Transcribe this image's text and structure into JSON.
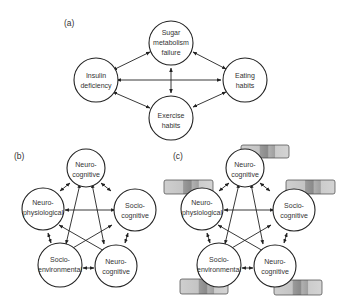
{
  "panels": {
    "a": {
      "label": "(a)",
      "nodes": [
        {
          "id": "sugar",
          "lines": [
            "Sugar",
            "metabolism",
            "failure"
          ]
        },
        {
          "id": "insulin",
          "lines": [
            "Insulin",
            "deficiency"
          ]
        },
        {
          "id": "eating",
          "lines": [
            "Eating",
            "habits"
          ]
        },
        {
          "id": "exercise",
          "lines": [
            "Exercise",
            "habits"
          ]
        }
      ]
    },
    "b": {
      "label": "(b)",
      "nodes": [
        {
          "id": "top",
          "lines": [
            "Neuro-",
            "cognitive"
          ]
        },
        {
          "id": "left",
          "lines": [
            "Neuro-",
            "physiological"
          ]
        },
        {
          "id": "right",
          "lines": [
            "Socio-",
            "cognitive"
          ]
        },
        {
          "id": "bl",
          "lines": [
            "Socio-",
            "environmental"
          ]
        },
        {
          "id": "br",
          "lines": [
            "Neuro-",
            "cognitive"
          ]
        }
      ]
    },
    "c": {
      "label": "(c)",
      "nodes": [
        {
          "id": "top",
          "lines": [
            "Neuro-",
            "cognitive"
          ]
        },
        {
          "id": "left",
          "lines": [
            "Neuro-",
            "physiological"
          ]
        },
        {
          "id": "right",
          "lines": [
            "Socio-",
            "cognitive"
          ]
        },
        {
          "id": "bl",
          "lines": [
            "Socio-",
            "environmental"
          ]
        },
        {
          "id": "br",
          "lines": [
            "Neuro-",
            "cognitive"
          ]
        }
      ]
    }
  },
  "colors": {
    "stroke": "#222222",
    "bar_light": "#c8c8c8",
    "bar_dark": "#8e8e8e",
    "bar_mid": "#a8a8a8"
  }
}
